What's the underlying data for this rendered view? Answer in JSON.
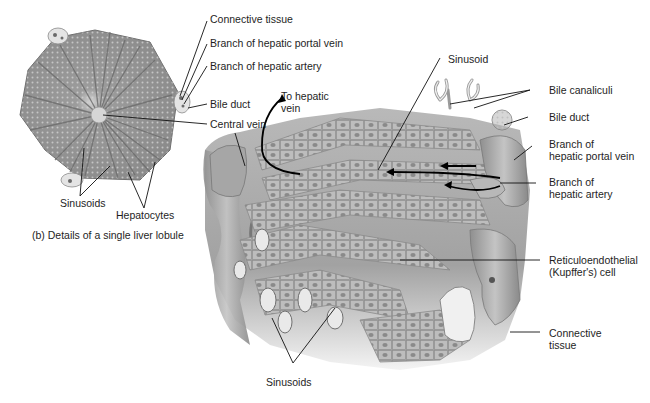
{
  "figure": {
    "caption": "(b) Details of a single liver lobule",
    "colors": {
      "background": "#ffffff",
      "tissue_light": "#cfcfcf",
      "tissue_mid": "#a9a9a9",
      "tissue_dark": "#7a7a7a",
      "label_text": "#1e1e1e",
      "leader_line": "#111111"
    }
  },
  "lobule_labels": {
    "connective_tissue": "Connective tissue",
    "branch_portal_vein": "Branch of hepatic portal vein",
    "branch_hepatic_artery": "Branch of hepatic artery",
    "bile_duct": "Bile duct",
    "central_vein": "Central vein",
    "sinusoids": "Sinusoids",
    "hepatocytes": "Hepatocytes"
  },
  "detail_labels": {
    "to_hepatic_vein": [
      "To hepatic",
      "vein"
    ],
    "sinusoid": "Sinusoid",
    "bile_canaliculi": "Bile canaliculi",
    "bile_duct": "Bile duct",
    "branch_portal_vein": [
      "Branch of",
      "hepatic portal vein"
    ],
    "branch_hepatic_artery": [
      "Branch of",
      "hepatic artery"
    ],
    "kupffer_cell": [
      "Reticuloendothelial",
      "(Kupffer's) cell"
    ],
    "connective_tissue": [
      "Connective",
      "tissue"
    ],
    "sinusoids": "Sinusoids"
  }
}
